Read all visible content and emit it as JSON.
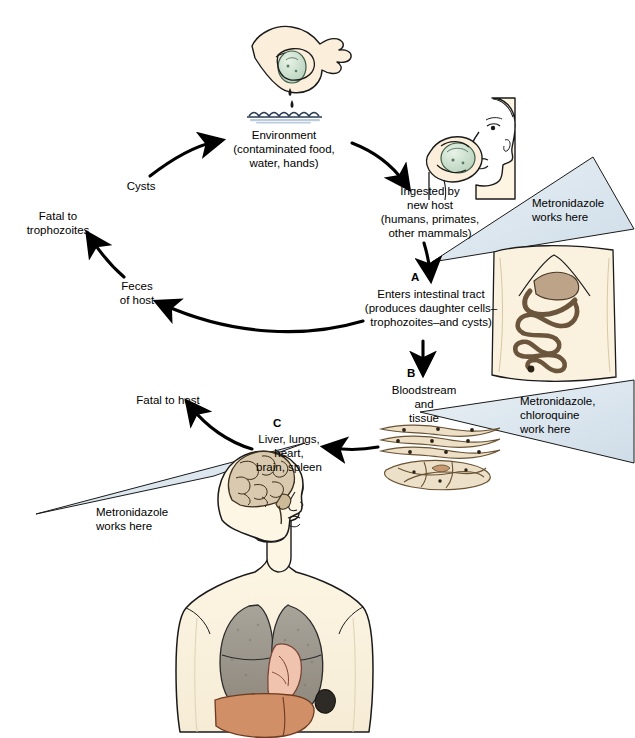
{
  "diagram": {
    "background_color": "#ffffff",
    "text_color": "#000000",
    "callout_fill": "#dce6ee",
    "callout_stroke": "#1a1a1a"
  },
  "nodes": {
    "environment": {
      "label": "Environment\n(contaminated food,\nwater, hands)"
    },
    "cysts": {
      "label": "Cysts"
    },
    "ingested": {
      "label": "Ingested by\nnew host\n(humans, primates,\nother mammals)"
    },
    "intestinal": {
      "letter": "A",
      "label": "Enters intestinal tract\n(produces daughter cells–\ntrophozoites–and cysts)"
    },
    "bloodstream": {
      "letter": "B",
      "label": "Bloodstream\nand\ntissue"
    },
    "organs": {
      "letter": "C",
      "label": "Liver, lungs,\nheart,\nbrain, spleen"
    },
    "feces": {
      "label": "Feces\nof host"
    },
    "fatal_trophozoites": {
      "label": "Fatal to\ntrophozoites"
    },
    "fatal_host": {
      "label": "Fatal to host"
    }
  },
  "callouts": [
    {
      "id": "callout-intestinal",
      "label": "Metronidazole\nworks here"
    },
    {
      "id": "callout-bloodstream",
      "label": "Metronidazole,\nchloroquine\nwork here"
    },
    {
      "id": "callout-organs",
      "label": "Metronidazole\nworks here"
    }
  ],
  "illustrations": [
    {
      "id": "hand-dropping-cyst",
      "name": "hand-dropping-cyst-into-water"
    },
    {
      "id": "head-ingesting",
      "name": "head-ingesting-contaminated-food"
    },
    {
      "id": "abdomen-intestines",
      "name": "abdomen-with-intestinal-tract"
    },
    {
      "id": "tissue-cells",
      "name": "muscle-tissue-cells"
    },
    {
      "id": "torso-organs",
      "name": "human-torso-with-organs"
    }
  ]
}
